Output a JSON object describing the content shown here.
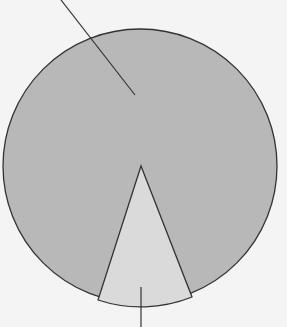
{
  "diagram": {
    "type": "pie-with-leader-lines",
    "background": "#f4f4f4",
    "circle": {
      "cx": 140,
      "cy": 166,
      "r": 137,
      "fill": "#b8b8b8",
      "stroke": "#333333"
    },
    "wedge": {
      "apex": [
        141,
        166
      ],
      "left_point": [
        98,
        300
      ],
      "right_point": [
        192,
        297
      ],
      "fill": "#dadada",
      "stroke": "#333333"
    },
    "leader_lines": [
      {
        "name": "large-segment-leader",
        "x1": 61,
        "y1": 0,
        "x2": 135,
        "y2": 95
      },
      {
        "name": "small-segment-leader",
        "x1": 141,
        "y1": 287,
        "x2": 141,
        "y2": 327
      }
    ],
    "labels": []
  }
}
